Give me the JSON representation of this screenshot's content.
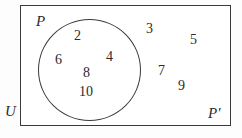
{
  "figure": {
    "kind": "venn-diagram",
    "background_color": "#fdfdfd",
    "stroke_color": "#3a3a3a",
    "text_color": "#2b2b2b"
  },
  "universe": {
    "label": "U",
    "label_x": 5,
    "label_y": 104,
    "rect_x": 20,
    "rect_y": 5,
    "rect_w": 211,
    "rect_h": 121
  },
  "set": {
    "label": "P",
    "label_x": 36,
    "label_y": 14,
    "circle_x": 38,
    "circle_y": 19,
    "circle_w": 103,
    "circle_h": 102
  },
  "complement": {
    "label": "P′",
    "label_x": 208,
    "label_y": 106
  },
  "elements_in_set": [
    {
      "value": "2",
      "x": 74,
      "y": 29
    },
    {
      "value": "6",
      "x": 55,
      "y": 53
    },
    {
      "value": "4",
      "x": 106,
      "y": 50
    },
    {
      "value": "8",
      "x": 83,
      "y": 66
    },
    {
      "value": "10",
      "x": 79,
      "y": 85
    }
  ],
  "elements_in_complement": [
    {
      "value": "3",
      "x": 146,
      "y": 22
    },
    {
      "value": "5",
      "x": 190,
      "y": 33
    },
    {
      "value": "7",
      "x": 158,
      "y": 64
    },
    {
      "value": "9",
      "x": 178,
      "y": 79
    }
  ]
}
